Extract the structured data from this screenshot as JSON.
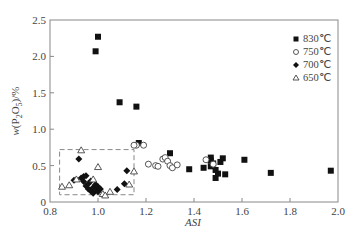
{
  "chart_data": {
    "type": "scatter",
    "title": "",
    "xlabel": "ASI",
    "ylabel": "w(P2O5)/%",
    "xlim": [
      0.8,
      2.0
    ],
    "ylim": [
      0,
      2.5
    ],
    "xticks": [
      "0.8",
      "1.0",
      "1.2",
      "1.4",
      "1.6",
      "1.8",
      "2.0"
    ],
    "yticks": [
      "0",
      "0.5",
      "1.0",
      "1.5",
      "2.0",
      "2.5"
    ],
    "grid": false,
    "legend_position": "upper right",
    "annotations": [
      {
        "type": "dashed-rectangle",
        "x0": 0.84,
        "x1": 1.15,
        "y0": 0.1,
        "y1": 0.72
      }
    ],
    "series": [
      {
        "name": "830℃",
        "marker": "filled-square",
        "points": [
          [
            1.0,
            2.27
          ],
          [
            0.99,
            2.07
          ],
          [
            1.09,
            1.37
          ],
          [
            1.16,
            1.31
          ],
          [
            1.17,
            0.81
          ],
          [
            1.3,
            0.67
          ],
          [
            1.38,
            0.45
          ],
          [
            1.44,
            0.47
          ],
          [
            1.47,
            0.61
          ],
          [
            1.47,
            0.57
          ],
          [
            1.47,
            0.49
          ],
          [
            1.48,
            0.53
          ],
          [
            1.49,
            0.44
          ],
          [
            1.49,
            0.33
          ],
          [
            1.5,
            0.39
          ],
          [
            1.51,
            0.55
          ],
          [
            1.52,
            0.6
          ],
          [
            1.53,
            0.38
          ],
          [
            1.61,
            0.58
          ],
          [
            1.72,
            0.4
          ],
          [
            1.97,
            0.43
          ]
        ]
      },
      {
        "name": "750℃",
        "marker": "open-circle",
        "points": [
          [
            1.16,
            0.78
          ],
          [
            1.19,
            0.78
          ],
          [
            1.21,
            0.52
          ],
          [
            1.24,
            0.5
          ],
          [
            1.25,
            0.49
          ],
          [
            1.27,
            0.59
          ],
          [
            1.28,
            0.61
          ],
          [
            1.29,
            0.56
          ],
          [
            1.3,
            0.5
          ],
          [
            1.31,
            0.47
          ],
          [
            1.33,
            0.51
          ],
          [
            1.45,
            0.58
          ],
          [
            1.48,
            0.52
          ],
          [
            1.15,
            0.78
          ]
        ]
      },
      {
        "name": "700℃",
        "marker": "filled-diamond",
        "points": [
          [
            0.92,
            0.59
          ],
          [
            0.9,
            0.3
          ],
          [
            0.93,
            0.33
          ],
          [
            0.94,
            0.35
          ],
          [
            0.95,
            0.36
          ],
          [
            0.94,
            0.28
          ],
          [
            0.95,
            0.22
          ],
          [
            0.96,
            0.18
          ],
          [
            0.96,
            0.25
          ],
          [
            0.97,
            0.15
          ],
          [
            0.97,
            0.29
          ],
          [
            0.98,
            0.12
          ],
          [
            0.98,
            0.2
          ],
          [
            0.99,
            0.16
          ],
          [
            0.99,
            0.24
          ],
          [
            1.0,
            0.14
          ],
          [
            1.0,
            0.21
          ],
          [
            1.01,
            0.18
          ],
          [
            1.08,
            0.17
          ],
          [
            1.12,
            0.43
          ],
          [
            1.11,
            0.25
          ]
        ]
      },
      {
        "name": "650℃",
        "marker": "open-triangle",
        "points": [
          [
            0.85,
            0.21
          ],
          [
            0.88,
            0.23
          ],
          [
            0.91,
            0.31
          ],
          [
            0.93,
            0.71
          ],
          [
            0.98,
            0.31
          ],
          [
            1.0,
            0.48
          ],
          [
            1.02,
            0.11
          ],
          [
            1.03,
            0.09
          ],
          [
            1.05,
            0.14
          ],
          [
            1.13,
            0.24
          ],
          [
            1.15,
            0.42
          ]
        ]
      }
    ]
  }
}
